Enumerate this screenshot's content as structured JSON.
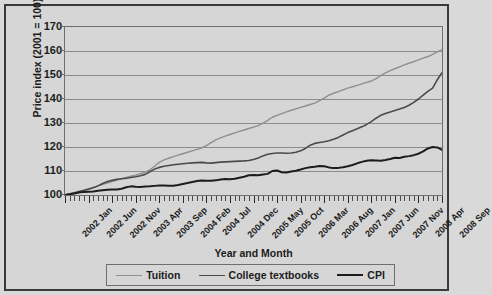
{
  "chart_data": {
    "type": "line",
    "title": "",
    "xlabel": "Year and Month",
    "ylabel": "Price index (2001 = 100)",
    "ylim": [
      100,
      170
    ],
    "yticks": [
      100,
      110,
      120,
      130,
      140,
      150,
      160,
      170
    ],
    "grid": true,
    "legend_position": "bottom",
    "x_tick_labels": [
      "2002 Jan",
      "2002 Jun",
      "2002 Nov",
      "2003 Apr",
      "2003 Sep",
      "2004 Feb",
      "2004 Jul",
      "2004 Dec",
      "2005 May",
      "2005 Oct",
      "2006 Mar",
      "2006 Aug",
      "2007 Jan",
      "2007 Jun",
      "2007 Nov",
      "2008 Apr",
      "2008 Sep"
    ],
    "x_tick_indices": [
      0,
      5,
      10,
      15,
      20,
      25,
      30,
      35,
      40,
      45,
      50,
      55,
      60,
      65,
      70,
      75,
      80
    ],
    "x": [
      "2002 Jan",
      "2002 Feb",
      "2002 Mar",
      "2002 Apr",
      "2002 May",
      "2002 Jun",
      "2002 Jul",
      "2002 Aug",
      "2002 Sep",
      "2002 Oct",
      "2002 Nov",
      "2002 Dec",
      "2003 Jan",
      "2003 Feb",
      "2003 Mar",
      "2003 Apr",
      "2003 May",
      "2003 Jun",
      "2003 Jul",
      "2003 Aug",
      "2003 Sep",
      "2003 Oct",
      "2003 Nov",
      "2003 Dec",
      "2004 Jan",
      "2004 Feb",
      "2004 Mar",
      "2004 Apr",
      "2004 May",
      "2004 Jun",
      "2004 Jul",
      "2004 Aug",
      "2004 Sep",
      "2004 Oct",
      "2004 Nov",
      "2004 Dec",
      "2005 Jan",
      "2005 Feb",
      "2005 Mar",
      "2005 Apr",
      "2005 May",
      "2005 Jun",
      "2005 Jul",
      "2005 Aug",
      "2005 Sep",
      "2005 Oct",
      "2005 Nov",
      "2005 Dec",
      "2006 Jan",
      "2006 Feb",
      "2006 Mar",
      "2006 Apr",
      "2006 May",
      "2006 Jun",
      "2006 Jul",
      "2006 Aug",
      "2006 Sep",
      "2006 Oct",
      "2006 Nov",
      "2006 Dec",
      "2007 Jan",
      "2007 Feb",
      "2007 Mar",
      "2007 Apr",
      "2007 May",
      "2007 Jun",
      "2007 Jul",
      "2007 Aug",
      "2007 Sep",
      "2007 Oct",
      "2007 Nov",
      "2007 Dec",
      "2008 Jan",
      "2008 Feb",
      "2008 Mar",
      "2008 Apr",
      "2008 May",
      "2008 Jun",
      "2008 Jul",
      "2008 Aug",
      "2008 Sep"
    ],
    "series": [
      {
        "name": "Tuition",
        "color": "#8f8f8f",
        "width": 1.4,
        "values": [
          100.0,
          100.5,
          101.0,
          101.5,
          102.0,
          102.6,
          103.2,
          103.8,
          104.4,
          105.0,
          105.6,
          106.2,
          106.8,
          107.3,
          107.8,
          108.3,
          108.9,
          109.5,
          110.5,
          112.0,
          113.6,
          114.6,
          115.3,
          116.0,
          116.6,
          117.2,
          117.8,
          118.4,
          119.0,
          119.6,
          120.6,
          121.8,
          123.0,
          123.8,
          124.5,
          125.2,
          125.9,
          126.5,
          127.1,
          127.7,
          128.3,
          128.9,
          129.9,
          131.1,
          132.4,
          133.2,
          133.9,
          134.6,
          135.3,
          135.9,
          136.5,
          137.1,
          137.7,
          138.3,
          139.3,
          140.4,
          141.6,
          142.4,
          143.1,
          143.8,
          144.5,
          145.1,
          145.7,
          146.3,
          146.9,
          147.5,
          148.5,
          149.7,
          150.9,
          151.8,
          152.6,
          153.4,
          154.2,
          154.9,
          155.6,
          156.3,
          157.0,
          157.7,
          158.6,
          159.6,
          160.6
        ]
      },
      {
        "name": "College textbooks",
        "color": "#4a4a4a",
        "width": 1.6,
        "values": [
          100.0,
          100.4,
          100.9,
          101.4,
          101.9,
          102.4,
          103.0,
          103.8,
          104.8,
          105.6,
          106.1,
          106.5,
          106.8,
          107.0,
          107.3,
          107.6,
          108.0,
          108.6,
          109.7,
          110.8,
          111.5,
          112.0,
          112.3,
          112.6,
          112.8,
          113.0,
          113.2,
          113.4,
          113.5,
          113.6,
          113.4,
          113.3,
          113.5,
          113.7,
          113.8,
          113.9,
          114.0,
          114.1,
          114.2,
          114.4,
          114.8,
          115.4,
          116.3,
          117.0,
          117.3,
          117.5,
          117.5,
          117.4,
          117.5,
          117.8,
          118.4,
          119.4,
          120.7,
          121.5,
          121.9,
          122.2,
          122.6,
          123.2,
          124.0,
          125.0,
          126.0,
          126.8,
          127.6,
          128.4,
          129.4,
          130.6,
          132.0,
          133.2,
          134.0,
          134.6,
          135.2,
          135.8,
          136.5,
          137.4,
          138.6,
          140.0,
          141.6,
          143.2,
          144.5,
          148.0,
          151.0
        ]
      },
      {
        "name": "CPI",
        "color": "#1c1c1c",
        "width": 2.0,
        "values": [
          100.0,
          100.3,
          100.6,
          101.0,
          101.3,
          101.4,
          101.5,
          101.8,
          102.0,
          102.2,
          102.3,
          102.3,
          102.6,
          103.2,
          103.6,
          103.4,
          103.3,
          103.5,
          103.6,
          103.8,
          104.0,
          104.0,
          103.9,
          103.9,
          104.2,
          104.6,
          105.0,
          105.4,
          105.8,
          106.0,
          105.9,
          105.9,
          106.1,
          106.5,
          106.7,
          106.6,
          106.8,
          107.2,
          107.6,
          108.2,
          108.3,
          108.2,
          108.5,
          108.8,
          110.0,
          110.2,
          109.5,
          109.4,
          109.8,
          110.1,
          110.6,
          111.2,
          111.6,
          111.8,
          112.1,
          112.0,
          111.5,
          111.2,
          111.3,
          111.6,
          112.0,
          112.5,
          113.2,
          113.8,
          114.3,
          114.5,
          114.4,
          114.3,
          114.6,
          115.0,
          115.5,
          115.4,
          115.9,
          116.2,
          116.6,
          117.2,
          118.2,
          119.4,
          120.0,
          119.8,
          118.8
        ]
      }
    ]
  },
  "legend": {
    "entries": [
      {
        "label": "Tuition"
      },
      {
        "label": "College textbooks"
      },
      {
        "label": "CPI"
      }
    ]
  },
  "colors": {
    "figure_background": "#d6d6d6",
    "figure_border": "#3a3a3a",
    "gridline": "#8c8c8c",
    "axis": "#6e6e6e",
    "text": "#1c1c1c"
  }
}
